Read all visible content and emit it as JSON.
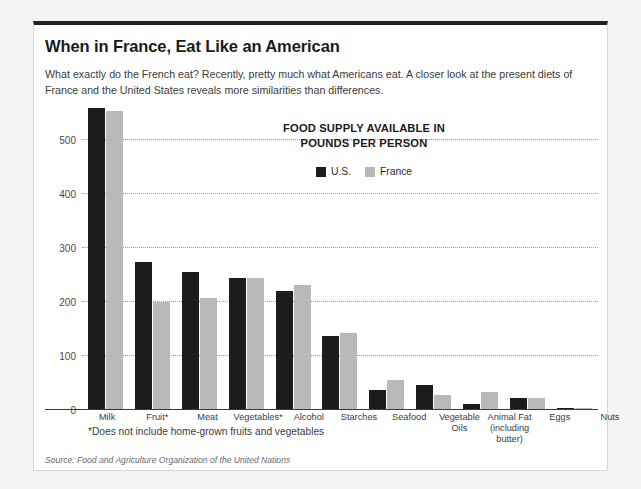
{
  "headline": "When in France, Eat Like an American",
  "deck": "What exactly do the French eat? Recently, pretty much what Americans eat. A closer look at the present diets of France and the United States reveals more similarities than differences.",
  "footnote": "*Does not include home-grown fruits and vegetables",
  "source": "Source: Food and Agriculture Organization of the United Nations",
  "colors": {
    "us": "#1c1c1c",
    "france": "#b9b9b9",
    "rule": "#231f20",
    "card_bg": "#ffffff",
    "page_bg": "#f4f4f4",
    "gridline": "#9b9b9b"
  },
  "chart_data": {
    "type": "bar",
    "title": "FOOD SUPPLY AVAILABLE IN POUNDS PER PERSON",
    "title_line1": "FOOD SUPPLY AVAILABLE IN",
    "title_line2": "POUNDS PER PERSON",
    "xlabel": "",
    "ylabel": "",
    "ylim": [
      0,
      565
    ],
    "yticks": [
      0,
      100,
      200,
      300,
      400,
      500
    ],
    "ytick_labels": [
      "0",
      "100",
      "200",
      "300",
      "400",
      "500"
    ],
    "grid": true,
    "legend_position": "top-center",
    "categories": [
      "Milk",
      "Fruit*",
      "Meat",
      "Vegetables*",
      "Alcohol",
      "Starches",
      "Seafood",
      "Vegetable Oils",
      "Animal Fat (including butter)",
      "Eggs",
      "Nuts"
    ],
    "category_labels": [
      "Milk",
      "Fruit*",
      "Meat",
      "Vegetables*",
      "Alcohol",
      "Starches",
      "Seafood",
      "Vegetable<br>Oils",
      "Animal Fat<br>(including<br>butter)",
      "Eggs",
      "Nuts"
    ],
    "series": [
      {
        "name": "U.S.",
        "color": "#1c1c1c",
        "values": [
          560,
          275,
          256,
          245,
          221,
          137,
          38,
          46,
          11,
          22,
          3
        ]
      },
      {
        "name": "France",
        "color": "#b9b9b9",
        "values": [
          554,
          200,
          208,
          244,
          232,
          142,
          55,
          28,
          34,
          23,
          4
        ]
      }
    ]
  }
}
